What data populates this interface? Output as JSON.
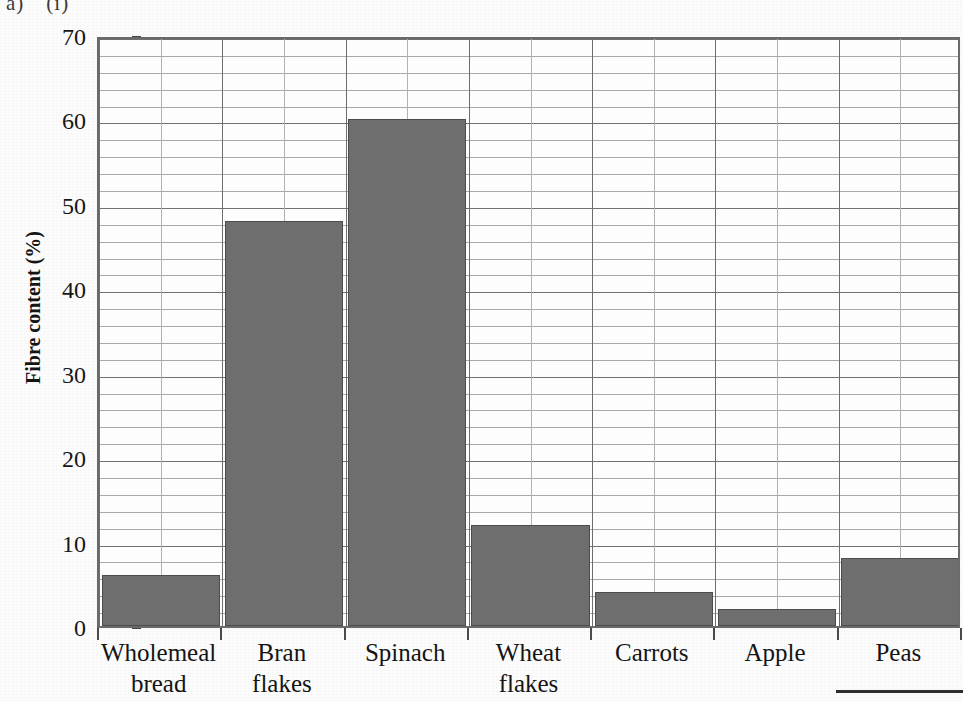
{
  "figure_label": {
    "part1": "a)",
    "part2": "(i)"
  },
  "chart_data": {
    "type": "bar",
    "title": "",
    "xlabel": "",
    "ylabel": "Fibre content (%)",
    "categories": [
      "Wholemeal bread",
      "Bran flakes",
      "Spinach",
      "Wheat flakes",
      "Carrots",
      "Apple",
      "Peas"
    ],
    "category_lines": [
      [
        "Wholemeal",
        "bread"
      ],
      [
        "Bran",
        "flakes"
      ],
      [
        "Spinach",
        ""
      ],
      [
        "Wheat",
        "flakes"
      ],
      [
        "Carrots",
        ""
      ],
      [
        "Apple",
        ""
      ],
      [
        "Peas",
        ""
      ]
    ],
    "values": [
      6,
      48,
      60,
      12,
      4,
      2,
      8
    ],
    "ylim": [
      0,
      70
    ],
    "y_ticks": [
      0,
      10,
      20,
      30,
      40,
      50,
      60,
      70
    ],
    "y_minor_step": 2,
    "grid": true,
    "legend": null,
    "bar_color": "#6e6e6e",
    "bar_edge_color": "#4d4d4d",
    "gridline_major_color": "#707070",
    "gridline_minor_color": "#a9a9a9",
    "axis_color": "#6a6a6a",
    "text_color": "#141414",
    "background": "#fdfdfd"
  }
}
